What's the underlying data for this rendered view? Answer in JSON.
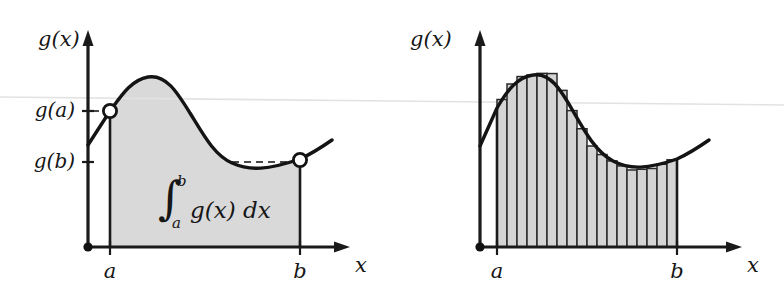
{
  "figure": {
    "kind": "integral-vs-riemann-sum",
    "background": "#ffffff",
    "ink_color": "#141414",
    "fill_color": "#d9d9d9",
    "bar_fill_color": "#d4d4d4",
    "scanline_color": "#e2e2e2"
  },
  "left_panel": {
    "y_axis_label": "g(x)",
    "x_axis_label": "x",
    "value_labels": [
      {
        "text": "g(a)"
      },
      {
        "text": "g(b)"
      }
    ],
    "bound_labels": [
      {
        "text": "a"
      },
      {
        "text": "b"
      }
    ],
    "integral": {
      "symbol": "∫",
      "lower_limit": "a",
      "upper_limit": "b",
      "integrand": "g(x) dx"
    }
  },
  "right_panel": {
    "y_axis_label": "g(x)",
    "x_axis_label": "x",
    "bound_labels": [
      {
        "text": "a"
      },
      {
        "text": "b"
      }
    ],
    "bar_count": 18
  },
  "chart_data": {
    "type": "area",
    "title": "",
    "xlabel": "x",
    "ylabel": "g(x)",
    "grid": false,
    "legend": null,
    "xlim": [
      0,
      10
    ],
    "ylim": [
      0,
      10
    ],
    "annotations": [
      "g(a)",
      "g(b)",
      "a",
      "b",
      "x",
      "g(x)"
    ],
    "series": [
      {
        "name": "g(x)",
        "x": [
          0.0,
          0.6,
          1.2,
          1.8,
          2.4,
          3.0,
          3.6,
          4.2,
          4.8,
          5.4,
          6.0,
          6.6,
          7.2,
          7.8,
          8.4,
          9.0,
          9.6
        ],
        "y": [
          4.2,
          5.3,
          6.6,
          7.7,
          8.5,
          8.8,
          8.6,
          7.9,
          6.8,
          5.6,
          4.5,
          3.7,
          3.2,
          3.0,
          3.1,
          3.5,
          4.3
        ]
      }
    ],
    "markers": [
      {
        "label": "g(a)",
        "x": 1.0,
        "y": 6.3,
        "style": "open-circle"
      },
      {
        "label": "g(b)",
        "x": 8.6,
        "y": 3.2,
        "style": "open-circle"
      }
    ],
    "shaded_region": {
      "from": "a",
      "to": "b",
      "x_from": 1.0,
      "x_to": 8.6
    },
    "riemann": {
      "type": "bar",
      "rule": "left-endpoint-rectangles",
      "n": 18,
      "x_from": 1.0,
      "x_to": 8.6
    }
  }
}
